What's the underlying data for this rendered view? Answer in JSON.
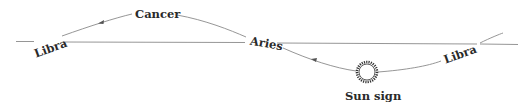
{
  "diagram": {
    "title": "",
    "labels": {
      "libra_left": "Libra",
      "cancer": "Cancer",
      "aries": "Aries",
      "libra_right": "Libra",
      "sun_sign": "Sun sign"
    },
    "elements": {
      "horizon_line": "horizontal reference line",
      "path_curve": "sinusoidal path of the sun through zodiac signs",
      "direction_arrows": [
        "left",
        "left"
      ],
      "sun_symbol": "sun-icon"
    },
    "colors": {
      "line": "#8a8a8a",
      "text": "#2a2a2a",
      "background": "#ffffff"
    }
  }
}
